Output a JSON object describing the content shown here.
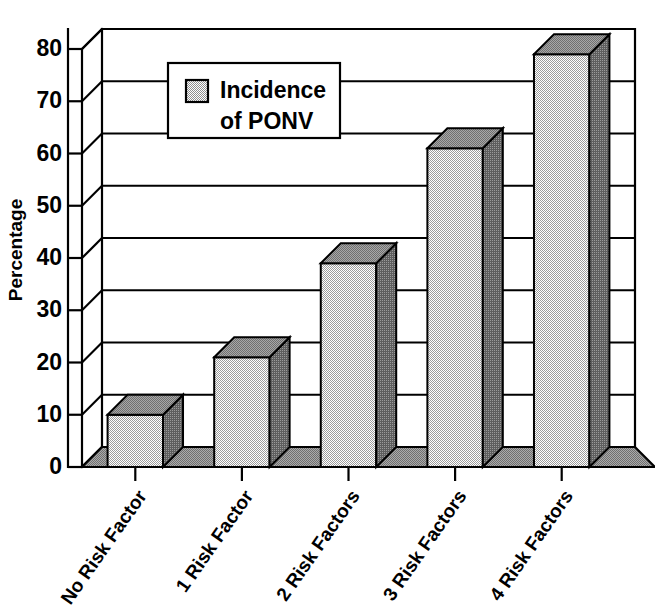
{
  "chart_data": {
    "type": "bar",
    "title": "",
    "subtitle": "",
    "xlabel": "",
    "ylabel": "Percentage",
    "categories": [
      "No Risk Factor",
      "1 Risk Factor",
      "2 Risk Factors",
      "3 Risk Factors",
      "4 Risk Factors"
    ],
    "values": [
      10,
      21,
      39,
      61,
      79
    ],
    "series": [
      {
        "name": "Incidence of PONV",
        "values": [
          10,
          21,
          39,
          61,
          79
        ]
      }
    ],
    "ylim": [
      0,
      80
    ],
    "yticks": [
      0,
      10,
      20,
      30,
      40,
      50,
      60,
      70,
      80
    ],
    "ytick_labels": [
      "0",
      "10",
      "20",
      "30",
      "40",
      "50",
      "60",
      "70",
      "80"
    ],
    "grid": true,
    "grid_axis": "y",
    "legend": {
      "position": "upper-left-inside",
      "entries": [
        "Incidence of PONV"
      ],
      "label_line_1": "Incidence",
      "label_line_2": "of PONV"
    },
    "style": {
      "three_d": true,
      "bar_face_color": "#c8c8c8",
      "bar_side_color": "#787878",
      "bar_top_color": "#8c8c8c",
      "floor_color": "#9a9a9a",
      "outline_color": "#000000",
      "background_color": "#ffffff",
      "category_label_rotation": -55
    }
  },
  "colors": {
    "accent": "#c8c8c8",
    "outline": "#000000",
    "background": "#ffffff",
    "shadow": "#787878"
  }
}
